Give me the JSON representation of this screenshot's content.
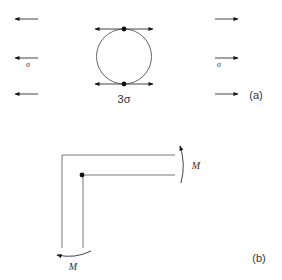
{
  "figure": {
    "panel_a": {
      "label": "(a)",
      "left_stress_label": "σ",
      "right_stress_label": "σ",
      "hole_stress_label": "3σ",
      "description": "Plate with circular hole under uniaxial tension σ; stress concentration 3σ at hole edges"
    },
    "panel_b": {
      "label": "(b)",
      "moment_label_right": "M",
      "moment_label_bottom": "M",
      "description": "L-shaped bar with re-entrant corner under bending moment M"
    },
    "colors": {
      "line": "#555555",
      "arrow": "#111111",
      "text": "#333333"
    }
  }
}
